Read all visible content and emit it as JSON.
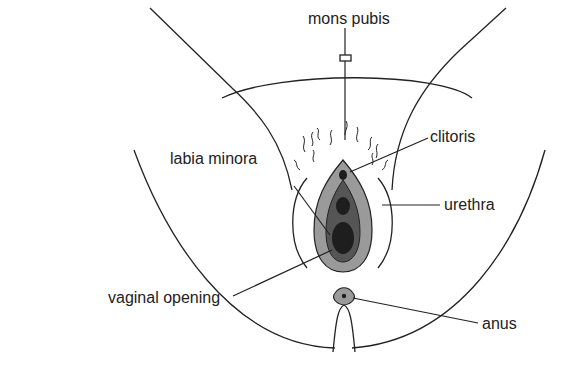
{
  "diagram": {
    "type": "labeled anatomical line drawing",
    "labels": {
      "mons_pubis": "mons pubis",
      "clitoris": "clitoris",
      "labia_minora": "labia minora",
      "urethra": "urethra",
      "vaginal_opening": "vaginal opening",
      "anus": "anus"
    },
    "colors": {
      "line": "#222222",
      "outer_fill": "#9a9a9a",
      "inner_fill": "#555555",
      "dark_fill": "#1e1e1e"
    }
  }
}
